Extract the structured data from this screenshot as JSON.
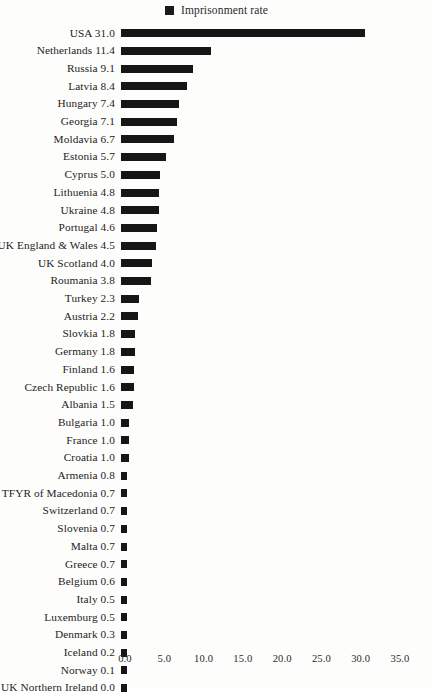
{
  "legend": {
    "marker_name": "legend-swatch-imprisonment-rate",
    "label": "Imprisonment rate",
    "color": "#161616"
  },
  "axis": {
    "x_tick_labels": [
      "0.0",
      "5.0",
      "10.0",
      "15.0",
      "20.0",
      "25.0",
      "30.0",
      "35.0"
    ]
  },
  "chart_data": {
    "type": "bar",
    "orientation": "horizontal",
    "title": "",
    "subtitle": "",
    "xlabel": "",
    "ylabel": "",
    "xlim": [
      0.0,
      35.0
    ],
    "xticks": [
      0.0,
      5.0,
      10.0,
      15.0,
      20.0,
      25.0,
      30.0,
      35.0
    ],
    "grid": false,
    "legend": [
      "Imprisonment rate"
    ],
    "legend_position": "top-center",
    "series_color": "#161616",
    "categories": [
      "USA",
      "Netherlands",
      "Russia",
      "Latvia",
      "Hungary",
      "Georgia",
      "Moldavia",
      "Estonia",
      "Cyprus",
      "Lithuenia",
      "Ukraine",
      "Portugal",
      "UK England & Wales",
      "UK Scotland",
      "Roumania",
      "Turkey",
      "Austria",
      "Slovkia",
      "Germany",
      "Finland",
      "Czech Republic",
      "Albania",
      "Bulgaria",
      "France",
      "Croatia",
      "Armenia",
      "TFYR of Macedonia",
      "Switzerland",
      "Slovenia",
      "Malta",
      "Greece",
      "Belgium",
      "Italy",
      "Luxemburg",
      "Denmark",
      "Iceland",
      "Norway",
      "UK Northern Ireland"
    ],
    "values": [
      31.0,
      11.4,
      9.1,
      8.4,
      7.4,
      7.1,
      6.7,
      5.7,
      5.0,
      4.8,
      4.8,
      4.6,
      4.5,
      4.0,
      3.8,
      2.3,
      2.2,
      1.8,
      1.8,
      1.6,
      1.6,
      1.5,
      1.0,
      1.0,
      1.0,
      0.8,
      0.7,
      0.7,
      0.7,
      0.7,
      0.7,
      0.6,
      0.5,
      0.5,
      0.3,
      0.2,
      0.1,
      0.0
    ],
    "row_labels": [
      "USA 31.0",
      "Netherlands 11.4",
      "Russia 9.1",
      "Latvia 8.4",
      "Hungary 7.4",
      "Georgia 7.1",
      "Moldavia 6.7",
      "Estonia 5.7",
      "Cyprus 5.0",
      "Lithuenia 4.8",
      "Ukraine 4.8",
      "Portugal 4.6",
      "UK England & Wales 4.5",
      "UK Scotland 4.0",
      "Roumania 3.8",
      "Turkey 2.3",
      "Austria 2.2",
      "Slovkia 1.8",
      "Germany 1.8",
      "Finland 1.6",
      "Czech Republic 1.6",
      "Albania 1.5",
      "Bulgaria 1.0",
      "France 1.0",
      "Croatia 1.0",
      "Armenia 0.8",
      "TFYR of Macedonia 0.7",
      "Switzerland 0.7",
      "Slovenia 0.7",
      "Malta 0.7",
      "Greece 0.7",
      "Belgium 0.6",
      "Italy 0.5",
      "Luxemburg 0.5",
      "Denmark 0.3",
      "Iceland 0.2",
      "Norway 0.1",
      "UK Northern Ireland 0.0"
    ]
  }
}
